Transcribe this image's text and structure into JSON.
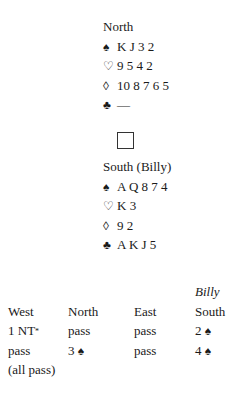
{
  "deal": {
    "north": {
      "label": "North",
      "spades": {
        "symbol": "♠",
        "cards": "K J 3 2"
      },
      "hearts": {
        "symbol": "♡",
        "cards": "9 5 4 2"
      },
      "diamonds": {
        "symbol": "◊",
        "cards": "10 8 7 6 5"
      },
      "clubs": {
        "symbol": "♣",
        "cards": "—"
      }
    },
    "table_icon": "square-box",
    "south": {
      "label": "South (Billy)",
      "spades": {
        "symbol": "♠",
        "cards": "A Q 8 7 4"
      },
      "hearts": {
        "symbol": "♡",
        "cards": "K 3"
      },
      "diamonds": {
        "symbol": "◊",
        "cards": "9 2"
      },
      "clubs": {
        "symbol": "♣",
        "cards": "A K J 5"
      }
    }
  },
  "bidding": {
    "player_note": "Billy",
    "headers": [
      "West",
      "North",
      "East",
      "South"
    ],
    "rounds": [
      {
        "west": "1 NT",
        "west_mark": "*",
        "north": "pass",
        "east": "pass",
        "south": "2",
        "south_suit": "♠"
      },
      {
        "west": "pass",
        "north": "3",
        "north_suit": "♠",
        "east": "pass",
        "south": "4",
        "south_suit": "♠"
      }
    ],
    "final": "(all pass)"
  }
}
